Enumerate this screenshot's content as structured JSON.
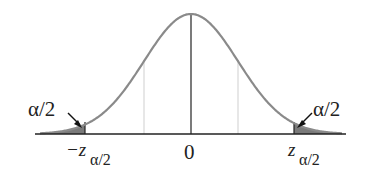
{
  "figure": {
    "type": "standard-normal-distribution-two-tailed",
    "labels": {
      "left_tail_area": "α/2",
      "right_tail_area": "α/2",
      "center_tick": "0",
      "left_critical_prefix": "−z",
      "left_critical_sub": "α/2",
      "right_critical_main": "z",
      "right_critical_sub": "α/2"
    },
    "colors": {
      "curve": "#8a8a8a",
      "shaded_tail": "#7a7a7a",
      "axis": "#222222",
      "center_line": "#333333",
      "sigma_lines": "#cfcfcf",
      "arrow": "#111111",
      "text": "#222222"
    }
  },
  "chart_data": {
    "type": "area",
    "title": "",
    "xlabel": "",
    "ylabel": "",
    "distribution": "standard normal",
    "mean": 0,
    "sd": 1,
    "x_ticks": [
      "−z_α/2",
      "0",
      "z_α/2"
    ],
    "critical_value_approx": 2.25,
    "shaded_regions": [
      {
        "name": "left tail",
        "from": "-inf",
        "to": "-z_α/2",
        "area_label": "α/2"
      },
      {
        "name": "right tail",
        "from": "z_α/2",
        "to": "+inf",
        "area_label": "α/2"
      }
    ],
    "reference_lines": [
      -1,
      0,
      1
    ],
    "grid": false,
    "legend": null
  }
}
